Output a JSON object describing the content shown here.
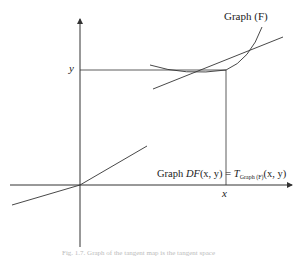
{
  "diagram": {
    "labels": {
      "graph_f": "Graph (F)",
      "y_label": "y",
      "x_label": "x",
      "eq_prefix": "Graph ",
      "eq_df": "DF",
      "eq_args": "(x, y)",
      "eq_equals": " = ",
      "eq_t": "T",
      "eq_sub": "Graph (F)",
      "eq_args2": "(x, y)"
    },
    "caption": "Fig. 1.7. Graph of the tangent map is the tangent space",
    "colors": {
      "line": "#333333",
      "background": "#ffffff"
    }
  }
}
